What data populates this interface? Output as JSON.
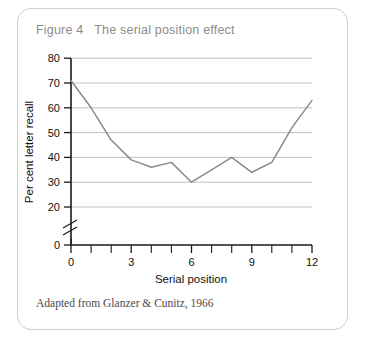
{
  "figure": {
    "title": "Figure 4   The serial position effect",
    "source": "Adapted from Glanzer & Cunitz, 1966"
  },
  "chart_data": {
    "type": "line",
    "title": "The serial position effect",
    "xlabel": "Serial position",
    "ylabel": "Per cent letter recall",
    "x": [
      0,
      1,
      2,
      3,
      4,
      5,
      6,
      7,
      8,
      9,
      10,
      11,
      12
    ],
    "values": [
      71,
      60,
      47,
      39,
      36,
      38,
      30,
      35,
      40,
      34,
      38,
      52,
      63
    ],
    "series": [
      {
        "name": "Per cent letter recall",
        "values": [
          71,
          60,
          47,
          39,
          36,
          38,
          30,
          35,
          40,
          34,
          38,
          52,
          63
        ]
      }
    ],
    "xlim": [
      0,
      12
    ],
    "ylim": [
      20,
      80
    ],
    "y_axis_break": true,
    "y_break_between": [
      0,
      20
    ],
    "xticks": [
      0,
      1,
      2,
      3,
      4,
      5,
      6,
      7,
      8,
      9,
      10,
      11,
      12
    ],
    "xtick_labels": [
      "0",
      "",
      "",
      "3",
      "",
      "",
      "6",
      "",
      "",
      "9",
      "",
      "",
      "12"
    ],
    "yticks": [
      0,
      20,
      30,
      40,
      50,
      60,
      70,
      80
    ],
    "ytick_labels": [
      "0",
      "20",
      "30",
      "40",
      "50",
      "60",
      "70",
      "80"
    ],
    "grid": true,
    "grid_axis": "y",
    "legend": false,
    "line_color": "#8a8a8a",
    "grid_color": "#b9b9b9",
    "axis_color": "#1a1a1a"
  },
  "colors": {
    "card_border": "#cfcfcf",
    "title_text": "#8c8c8c",
    "source_text": "#4a4a4a"
  }
}
